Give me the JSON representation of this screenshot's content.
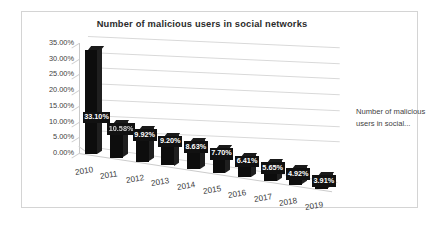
{
  "chart_data": {
    "type": "bar",
    "title": "Number of malicious users in social networks",
    "xlabel": "",
    "ylabel": "",
    "ylim": [
      0,
      35
    ],
    "grid": true,
    "legend_position": "right",
    "style": "3d-column",
    "categories": [
      "2010",
      "2011",
      "2012",
      "2013",
      "2014",
      "2015",
      "2016",
      "2017",
      "2018",
      "2019"
    ],
    "values": [
      33.1,
      10.58,
      9.92,
      9.2,
      8.63,
      7.7,
      6.41,
      5.65,
      4.92,
      3.91
    ],
    "value_labels": [
      "33.10%",
      "10.58%",
      "9.92%",
      "9.20%",
      "8.63%",
      "7.70%",
      "6.41%",
      "5.65%",
      "4.92%",
      "3.91%"
    ],
    "ytick_labels": [
      "35.00%",
      "30.00%",
      "25.00%",
      "20.00%",
      "15.00%",
      "10.00%",
      "5.00%",
      "0.00%"
    ],
    "ytick_values": [
      35,
      30,
      25,
      20,
      15,
      10,
      5,
      0
    ],
    "series": [
      {
        "name": "Number of malicious users in social...",
        "values": [
          33.1,
          10.58,
          9.92,
          9.2,
          8.63,
          7.7,
          6.41,
          5.65,
          4.92,
          3.91
        ]
      }
    ],
    "colors": {
      "bar": "#0d0d0d",
      "gridline": "#d9d9d9",
      "text": "#3f3f3f",
      "title": "#2b2b2b",
      "label_text": "#ffffff",
      "frame": "#d4d4d4"
    }
  },
  "legend": {
    "line1": "Number of malicious",
    "line2": "users in social..."
  }
}
